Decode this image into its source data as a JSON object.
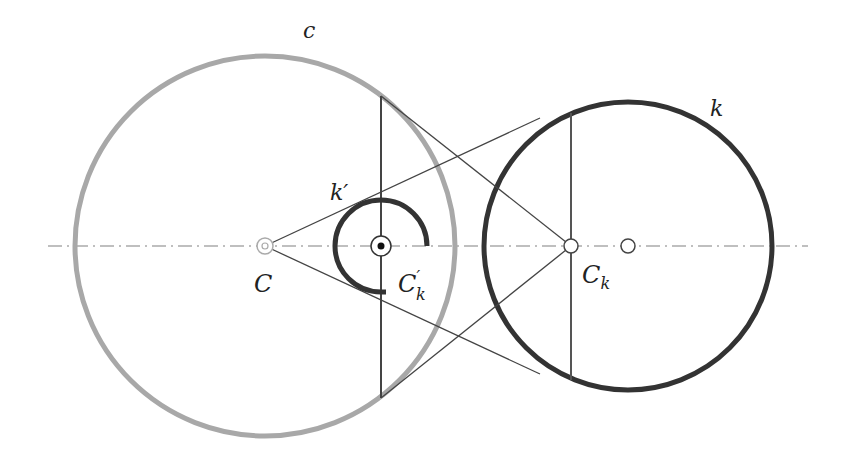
{
  "diagram": {
    "colors": {
      "background": "#ffffff",
      "circle_c": "#a8a8a8",
      "circle_k": "#333333",
      "lines": "#444444",
      "axis": "#aaaaaa"
    },
    "labels": {
      "c": "c",
      "k": "k",
      "k_prime": "k′",
      "C": "C",
      "C_k_prime_base": "C",
      "C_k_prime_sup": "′",
      "C_k_prime_sub": "k",
      "C_k_base": "C",
      "C_k_sub": "k"
    },
    "points": [
      {
        "name": "C",
        "x": 265,
        "y": 246
      },
      {
        "name": "C'_k",
        "x": 381,
        "y": 246
      },
      {
        "name": "C_k",
        "x": 571,
        "y": 246
      },
      {
        "name": "center_k",
        "x": 628,
        "y": 246
      }
    ],
    "circles": [
      {
        "name": "c",
        "cx": 265,
        "cy": 246,
        "r": 190
      },
      {
        "name": "k",
        "cx": 628,
        "cy": 246,
        "r": 144
      },
      {
        "name": "k_prime_arc",
        "cx": 381,
        "cy": 246,
        "r": 46,
        "sweep_deg": 270
      }
    ]
  }
}
